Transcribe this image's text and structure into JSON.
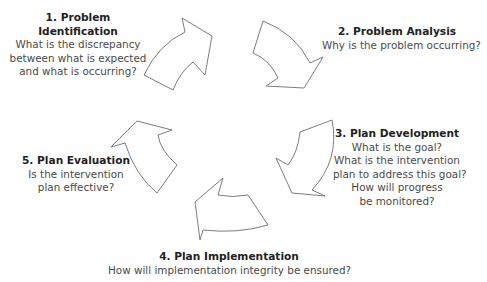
{
  "diagram": {
    "type": "cycle",
    "steps": [
      {
        "title": "1. Problem Identification",
        "lines": [
          "What is the discrepancy",
          "between what is expected",
          "and what is occurring?"
        ]
      },
      {
        "title": "2. Problem Analysis",
        "lines": [
          "Why is the problem occurring?"
        ]
      },
      {
        "title": "3. Plan Development",
        "lines": [
          "What is the goal?",
          "What is the intervention",
          "plan to address this goal?",
          "How will progress",
          "be monitored?"
        ]
      },
      {
        "title": "4. Plan Implementation",
        "lines": [
          "How will implementation integrity be ensured?"
        ]
      },
      {
        "title": "5. Plan Evaluation",
        "lines": [
          "Is the intervention",
          "plan effective?"
        ]
      }
    ],
    "arrow_stroke": "#6e6e6e",
    "arrow_fill": "#ffffff"
  }
}
